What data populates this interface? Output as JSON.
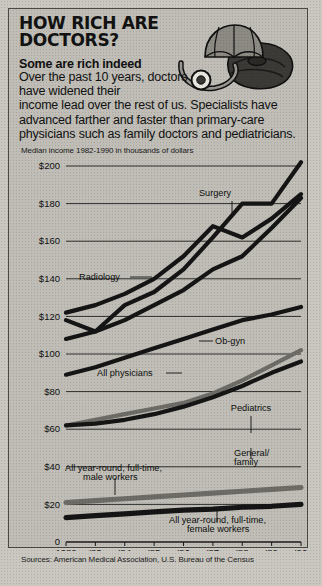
{
  "headline": "HOW RICH ARE DOCTORS?",
  "kicker": "Some are rich indeed",
  "deck_line1": "Over the past 10 years, doctors have widened their",
  "deck_line2": "income lead over the rest of us.  Specialists have advanced farther and faster than primary-care physicians such as family doctors and pediatricians.",
  "axis_note": "Median income 1982-1990 in thousands of dollars",
  "source": "Sources: American Medical Association, U.S. Bureau of the Census",
  "art": {
    "umbrella": "umbrella-icon",
    "bag": "doctor-bag-icon",
    "stethoscope": "stethoscope-icon"
  },
  "chart_data": {
    "type": "line",
    "title": "How rich are doctors?",
    "subtitle": "Median income 1982-1990 in thousands of dollars",
    "xlabel": "",
    "ylabel": "Median income (thousands of dollars)",
    "x": [
      "1982",
      "'83",
      "'84",
      "'85",
      "'86",
      "'87",
      "'88",
      "'89",
      "'90"
    ],
    "x_full": [
      1982,
      1983,
      1984,
      1985,
      1986,
      1987,
      1988,
      1989,
      1990
    ],
    "ylim": [
      0,
      200
    ],
    "ytick_labels": [
      "0",
      "$20",
      "$40",
      "$60",
      "$80",
      "$100",
      "$120",
      "$140",
      "$160",
      "$180",
      "$200"
    ],
    "ytick_values": [
      0,
      20,
      40,
      60,
      80,
      100,
      120,
      140,
      160,
      180,
      200
    ],
    "grid": true,
    "legend": "inline-annotations",
    "series": [
      {
        "name": "Surgery",
        "color": "#151515",
        "values": [
          118,
          112,
          126,
          133,
          145,
          162,
          180,
          180,
          202
        ]
      },
      {
        "name": "Radiology",
        "color": "#151515",
        "values": [
          122,
          126,
          132,
          140,
          152,
          168,
          162,
          172,
          185
        ]
      },
      {
        "name": "Ob-gyn",
        "color": "#151515",
        "values": [
          108,
          112,
          118,
          126,
          134,
          145,
          152,
          167,
          183
        ]
      },
      {
        "name": "All physicians",
        "color": "#151515",
        "values": [
          89,
          93,
          98,
          103,
          108,
          113,
          118,
          121,
          125
        ]
      },
      {
        "name": "Pediatrics",
        "color": "#6e6c66",
        "values": [
          62,
          65,
          68,
          71,
          74,
          79,
          86,
          94,
          102
        ]
      },
      {
        "name": "General/family",
        "color": "#151515",
        "values": [
          62,
          63,
          65,
          68,
          72,
          77,
          83,
          90,
          96
        ]
      },
      {
        "name": "All year-round, full-time, male workers",
        "color": "#6e6c66",
        "values": [
          21,
          22,
          23,
          24,
          25,
          26,
          27,
          28,
          29
        ]
      },
      {
        "name": "All year-round, full-time, female workers",
        "color": "#151515",
        "values": [
          13,
          14,
          15,
          16,
          17,
          17.5,
          18.5,
          19,
          20
        ]
      }
    ],
    "annotations": [
      {
        "text": "Surgery",
        "series": "Surgery"
      },
      {
        "text": "Radiology",
        "series": "Radiology"
      },
      {
        "text": "Ob-gyn",
        "series": "Ob-gyn"
      },
      {
        "text": "All physicians",
        "series": "All physicians"
      },
      {
        "text": "Pediatrics",
        "series": "Pediatrics"
      },
      {
        "text": "General/ family",
        "series": "General/family"
      },
      {
        "text": "All year-round, full-time, male workers",
        "series": "All year-round, full-time, male workers"
      },
      {
        "text": "All year-round, full-time, female workers",
        "series": "All year-round, full-time, female workers"
      }
    ],
    "label_surgery": "Surgery",
    "label_radiology": "Radiology",
    "label_obgyn": "Ob-gyn",
    "label_allphys": "All physicians",
    "label_pediatrics": "Pediatrics",
    "label_general_1": "General/",
    "label_general_2": "family",
    "label_male_1": "All year-round, full-time,",
    "label_male_2": "male workers",
    "label_female_1": "All year-round, full-time,",
    "label_female_2": "female workers"
  }
}
